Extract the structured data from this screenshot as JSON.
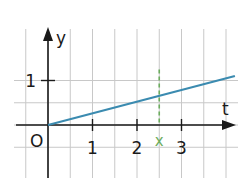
{
  "chart_data": {
    "type": "line",
    "title": "",
    "xlabel": "t",
    "ylabel": "y",
    "origin_label": "O",
    "x_ticks": [
      1,
      2,
      3
    ],
    "x_tick_labels": [
      "1",
      "2",
      "3"
    ],
    "y_ticks": [
      1
    ],
    "y_tick_labels": [
      "1"
    ],
    "xlim": [
      -0.5,
      4.2
    ],
    "ylim": [
      -0.75,
      1.35
    ],
    "grid": true,
    "grid_step": 0.5,
    "series": [
      {
        "name": "y = 0.5t",
        "x": [
          0,
          4.2
        ],
        "y": [
          0,
          1.1
        ],
        "color": "#3b8bb0"
      }
    ],
    "annotations": [
      {
        "type": "vertical-dashed-marker",
        "label": "x",
        "x": 2.5,
        "y_from": 0,
        "y_to": 1.25,
        "color": "#6cad5e"
      }
    ]
  }
}
